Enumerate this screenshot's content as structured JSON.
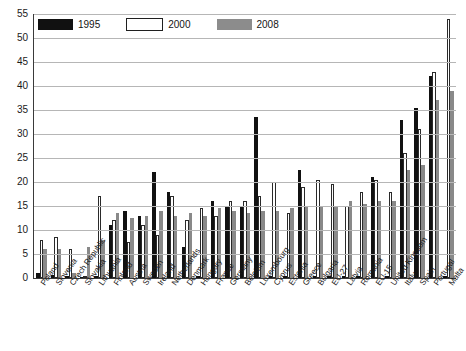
{
  "legend": {
    "entries": [
      {
        "label": "1995",
        "color": "#111111",
        "name": "legend-1995"
      },
      {
        "label": "2000",
        "color": "#ffffff",
        "name": "legend-2000"
      },
      {
        "label": "2008",
        "color": "#8c8c8c",
        "name": "legend-2008"
      }
    ]
  },
  "axis": {
    "y_ticks": [
      "0",
      "5",
      "10",
      "15",
      "20",
      "25",
      "30",
      "35",
      "40",
      "45",
      "50",
      "55"
    ]
  },
  "footer": {
    "note": ""
  },
  "chart_data": {
    "type": "bar",
    "title": "",
    "subtitle": "",
    "xlabel": "",
    "ylabel": "",
    "ylim": [
      0,
      55
    ],
    "ytick_step": 5,
    "grid": true,
    "legend_position": "top-left",
    "categories": [
      "Poland",
      "Slovenia",
      "Czech Republic",
      "Slovakia",
      "Lithuania",
      "Finland",
      "Austria",
      "Sweden",
      "Ireland",
      "Netherlands",
      "Denmark",
      "Hungary",
      "France",
      "Germany",
      "Belgium",
      "Luxembourg",
      "Cyprus",
      "Estonia",
      "Greece",
      "Bulgaria",
      "EU-27",
      "Latvia",
      "Romania",
      "EU-15",
      "United Kingdom",
      "Italy",
      "Spain",
      "Portugal",
      "Malta"
    ],
    "series": [
      {
        "name": "1995",
        "color": "#111111",
        "values": [
          1.0,
          0.6,
          0.4,
          0.3,
          0.4,
          11.0,
          14.0,
          13.0,
          22.0,
          18.0,
          6.5,
          0.5,
          16.0,
          15.0,
          15.0,
          33.5,
          0.5,
          0.4,
          22.5,
          0.5,
          0.5,
          0.4,
          0.4,
          21.0,
          0.5,
          33.0,
          35.5,
          42.0,
          0.5
        ]
      },
      {
        "name": "2000",
        "color": "#ffffff",
        "values": [
          8.0,
          8.5,
          6.0,
          0.3,
          17.0,
          12.0,
          7.5,
          11.0,
          9.0,
          17.0,
          12.0,
          14.5,
          13.0,
          16.0,
          16.0,
          17.0,
          20.0,
          13.5,
          19.0,
          20.5,
          19.5,
          15.0,
          18.0,
          20.5,
          18.0,
          26.0,
          31.0,
          43.0,
          54.0
        ]
      },
      {
        "name": "2008",
        "color": "#8c8c8c",
        "values": [
          6.0,
          6.0,
          1.0,
          6.5,
          8.0,
          13.5,
          12.5,
          13.0,
          14.0,
          13.0,
          13.5,
          13.0,
          14.5,
          14.0,
          13.5,
          14.0,
          14.0,
          14.5,
          15.0,
          15.0,
          15.0,
          16.0,
          15.5,
          16.0,
          16.0,
          22.5,
          23.5,
          37.0,
          39.0
        ]
      }
    ]
  }
}
